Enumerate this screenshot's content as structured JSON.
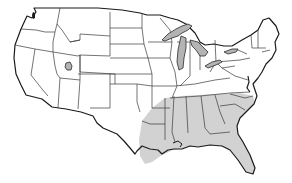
{
  "map": {
    "title": "United States map",
    "description": "Contiguous United States with southeastern region shaded",
    "shaded_region_label": "Southeastern United States",
    "shaded_states": [
      "Texas (east)",
      "Louisiana",
      "Arkansas (south)",
      "Mississippi",
      "Alabama",
      "Georgia",
      "Florida",
      "South Carolina",
      "North Carolina (south)"
    ],
    "water_bodies": [
      "Great Lakes",
      "Great Salt Lake",
      "Puget Sound",
      "Chesapeake Bay"
    ],
    "colors": {
      "background": "#ffffff",
      "state_fill": "#ffffff",
      "border": "#3a3a3a",
      "shaded_fill": "#d2d2d2",
      "lake_fill": "#b4b4b4"
    }
  }
}
